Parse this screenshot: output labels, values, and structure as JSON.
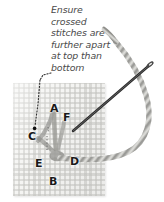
{
  "figure": {
    "title_caption": "Ensure\ncrossed\nstitches are\nfurther apart\nat top than\nbottom",
    "fabric": {
      "name": "aida-cloth",
      "color": "#f4f4f2",
      "weave_color": "#c4c4c0"
    },
    "needle": {
      "name": "sewing-needle",
      "color": "#3a3a3a"
    },
    "thread": {
      "name": "embroidery-thread",
      "color": "#a8a8a4"
    },
    "stitch": {
      "name": "crossed-stitches",
      "color": "#8d8d8a"
    },
    "leader": {
      "name": "dotted-leader-line",
      "color": "#2a2a2a",
      "target_point_label": "C"
    },
    "labels": [
      {
        "id": "A",
        "text": "A",
        "x": 50,
        "y": 103
      },
      {
        "id": "F",
        "text": "F",
        "x": 63,
        "y": 112
      },
      {
        "id": "C",
        "text": "C",
        "x": 28,
        "y": 131
      },
      {
        "id": "E",
        "text": "E",
        "x": 35,
        "y": 158
      },
      {
        "id": "D",
        "text": "D",
        "x": 70,
        "y": 156
      },
      {
        "id": "B",
        "text": "B",
        "x": 49,
        "y": 176
      }
    ]
  }
}
